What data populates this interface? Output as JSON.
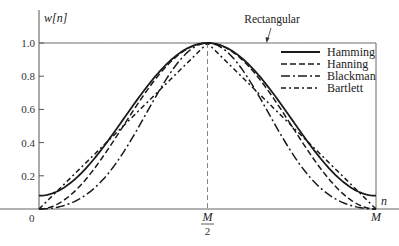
{
  "chart_data": {
    "type": "line",
    "title": "",
    "xlabel": "n",
    "ylabel": "w[n]",
    "ylim": [
      0,
      1.0
    ],
    "xlim": [
      0,
      "M"
    ],
    "grid": false,
    "legend_position": "upper right (inside)",
    "x_ticks": [
      {
        "pos": 0,
        "label": "0"
      },
      {
        "pos": 0.5,
        "label_num": "M",
        "label_den": "2"
      },
      {
        "pos": 1,
        "label": "M"
      }
    ],
    "y_ticks": [
      {
        "value": 0.2,
        "label": "0.2"
      },
      {
        "value": 0.4,
        "label": "0.4"
      },
      {
        "value": 0.6,
        "label": "0.6"
      },
      {
        "value": 0.8,
        "label": "0.8"
      },
      {
        "value": 1.0,
        "label": "1.0"
      }
    ],
    "x_normalized": [
      0,
      0.05,
      0.1,
      0.15,
      0.2,
      0.25,
      0.3,
      0.35,
      0.4,
      0.45,
      0.5,
      0.55,
      0.6,
      0.65,
      0.7,
      0.75,
      0.8,
      0.85,
      0.9,
      0.95,
      1.0
    ],
    "series": [
      {
        "name": "Rectangular",
        "style": "solid-thin",
        "values": [
          1,
          1,
          1,
          1,
          1,
          1,
          1,
          1,
          1,
          1,
          1,
          1,
          1,
          1,
          1,
          1,
          1,
          1,
          1,
          1,
          1
        ]
      },
      {
        "name": "Hamming",
        "style": "solid",
        "values": [
          0.08,
          0.102,
          0.167,
          0.267,
          0.391,
          0.54,
          0.682,
          0.81,
          0.912,
          0.977,
          1.0,
          0.977,
          0.912,
          0.81,
          0.682,
          0.54,
          0.391,
          0.267,
          0.167,
          0.102,
          0.08
        ]
      },
      {
        "name": "Hanning",
        "style": "dashed",
        "values": [
          0,
          0.024,
          0.095,
          0.206,
          0.345,
          0.5,
          0.655,
          0.794,
          0.905,
          0.976,
          1.0,
          0.976,
          0.905,
          0.794,
          0.655,
          0.5,
          0.345,
          0.206,
          0.095,
          0.024,
          0
        ]
      },
      {
        "name": "Blackman",
        "style": "dash-dot-long",
        "values": [
          0,
          0.01,
          0.04,
          0.109,
          0.2,
          0.34,
          0.509,
          0.664,
          0.849,
          0.96,
          1.0,
          0.96,
          0.849,
          0.664,
          0.509,
          0.34,
          0.2,
          0.109,
          0.04,
          0.01,
          0
        ]
      },
      {
        "name": "Bartlett",
        "style": "dash-dot",
        "values": [
          0,
          0.1,
          0.2,
          0.3,
          0.4,
          0.5,
          0.6,
          0.7,
          0.8,
          0.9,
          1.0,
          0.9,
          0.8,
          0.7,
          0.6,
          0.5,
          0.4,
          0.3,
          0.2,
          0.1,
          0
        ]
      }
    ],
    "annotations": [
      {
        "text": "Rectangular",
        "points_to": "top edge at w=1.0"
      }
    ]
  },
  "labels": {
    "ylabel": "w[n]",
    "xlabel": "n",
    "rectangular": "Rectangular",
    "x0": "0",
    "xmid_num": "M",
    "xmid_den": "2",
    "xend": "M"
  },
  "legend": [
    {
      "name": "Hamming",
      "style": "solid"
    },
    {
      "name": "Hanning",
      "style": "dashed"
    },
    {
      "name": "Blackman",
      "style": "dash-dot-long"
    },
    {
      "name": "Bartlett",
      "style": "dash-dot"
    }
  ],
  "colors": {
    "line": "#1a1a1a",
    "axis": "#555555",
    "text": "#222222"
  }
}
